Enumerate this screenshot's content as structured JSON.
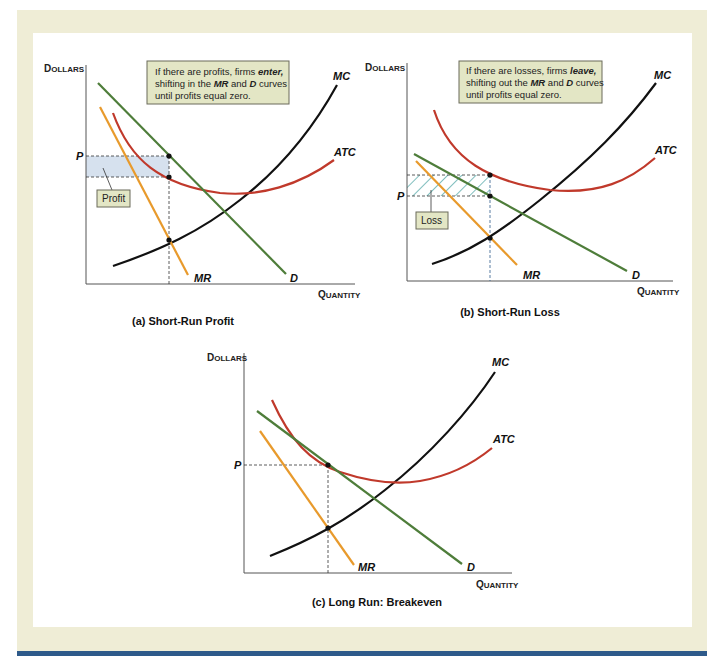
{
  "colors": {
    "frame_bg": "#efedd6",
    "inner_bg": "#ffffff",
    "bottom_bar": "#2e5a8a",
    "mc": "#111111",
    "atc": "#c0392b",
    "demand": "#4e7d3a",
    "mr": "#e89a2c",
    "note_bg": "#e3e6c5",
    "note_border": "#6b6b5a",
    "profit_fill": "#d6e1ee",
    "loss_hatch": "#3a9a9a",
    "guide": "#333333",
    "axis": "#555555"
  },
  "panels": [
    {
      "id": "a",
      "caption": "(a) Short-Run Profit",
      "y_axis_label": {
        "first": "D",
        "rest": "OLLARS"
      },
      "x_axis_label": {
        "first": "Q",
        "rest": "UANTITY"
      },
      "price_label": "P",
      "curve_labels": {
        "mc": "MC",
        "atc": "ATC",
        "mr": "MR",
        "d": "D"
      },
      "note": {
        "line1_pre": "If there are profits, firms ",
        "line1_em": "enter,",
        "line2_pre": "shifting in the ",
        "line2_em1": "MR",
        "line2_mid": " and ",
        "line2_em2": "D",
        "line2_post": " curves",
        "line3": "until profits equal zero."
      },
      "area_label": "Profit"
    },
    {
      "id": "b",
      "caption": "(b) Short-Run Loss",
      "y_axis_label": {
        "first": "D",
        "rest": "OLLARS"
      },
      "x_axis_label": {
        "first": "Q",
        "rest": "UANTITY"
      },
      "price_label": "P",
      "curve_labels": {
        "mc": "MC",
        "atc": "ATC",
        "mr": "MR",
        "d": "D"
      },
      "note": {
        "line1_pre": "If there are losses, firms ",
        "line1_em": "leave,",
        "line2_pre": "shifting out the ",
        "line2_em1": "MR",
        "line2_mid": " and ",
        "line2_em2": "D",
        "line2_post": " curves",
        "line3": "until profits equal zero."
      },
      "area_label": "Loss"
    },
    {
      "id": "c",
      "caption": "(c) Long Run: Breakeven",
      "y_axis_label": {
        "first": "D",
        "rest": "OLLARS"
      },
      "x_axis_label": {
        "first": "Q",
        "rest": "UANTITY"
      },
      "price_label": "P",
      "curve_labels": {
        "mc": "MC",
        "atc": "ATC",
        "mr": "MR",
        "d": "D"
      }
    }
  ]
}
